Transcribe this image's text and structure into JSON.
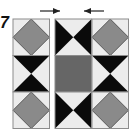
{
  "diagram": {
    "step_label": "7",
    "colors": {
      "background": "#ececec",
      "outline": "#8c8c8c",
      "diamond": "#8a8a8a",
      "center_square": "#666666",
      "dark_triangle": "#0a0a0a",
      "arrow": "#222222"
    },
    "arrows": [
      {
        "name": "arrow-right",
        "direction": "right",
        "x1": 40,
        "x2": 60,
        "y": 11
      },
      {
        "name": "arrow-left",
        "direction": "left",
        "x1": 104,
        "x2": 84,
        "y": 11
      }
    ],
    "columns": [
      {
        "name": "left-column",
        "x": 13,
        "cells": [
          "diamond",
          "hourglass-vertical",
          "diamond"
        ]
      },
      {
        "name": "middle-column",
        "x": 55,
        "cells": [
          "hourglass-horizontal",
          "center-square",
          "hourglass-horizontal"
        ]
      },
      {
        "name": "right-column",
        "x": 92,
        "cells": [
          "diamond",
          "hourglass-vertical",
          "diamond"
        ]
      }
    ],
    "cell_size": 36.5,
    "top": 19
  }
}
